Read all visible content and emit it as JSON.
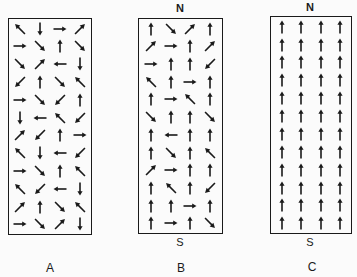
{
  "panels": [
    {
      "id": "A",
      "label": "A",
      "north_label": "",
      "south_label": "",
      "description": "Unmagnetized - random domain orientations",
      "rows": [
        [
          "nw",
          "s",
          "e",
          "ne"
        ],
        [
          "e",
          "se",
          "n",
          "se"
        ],
        [
          "se",
          "ne",
          "w",
          "s"
        ],
        [
          "sw",
          "n",
          "se",
          "nw"
        ],
        [
          "e",
          "se",
          "sw",
          "n"
        ],
        [
          "s",
          "w",
          "nw",
          "sw"
        ],
        [
          "ne",
          "sw",
          "n",
          "e"
        ],
        [
          "nw",
          "s",
          "w",
          "sw"
        ],
        [
          "e",
          "se",
          "n",
          "nw"
        ],
        [
          "nw",
          "sw",
          "w",
          "s"
        ],
        [
          "ne",
          "n",
          "se",
          "nw"
        ],
        [
          "e",
          "se",
          "ne",
          "s"
        ]
      ]
    },
    {
      "id": "B",
      "label": "B",
      "north_label": "N",
      "south_label": "S",
      "description": "Partially magnetized - majority of domains aligned",
      "rows": [
        [
          "n",
          "se",
          "ne",
          "n"
        ],
        [
          "ne",
          "e",
          "n",
          "ne"
        ],
        [
          "e",
          "n",
          "n",
          "sw"
        ],
        [
          "nw",
          "n",
          "e",
          "n"
        ],
        [
          "n",
          "e",
          "nw",
          "n"
        ],
        [
          "se",
          "n",
          "n",
          "se"
        ],
        [
          "n",
          "w",
          "n",
          "n"
        ],
        [
          "n",
          "se",
          "n",
          "nw"
        ],
        [
          "ne",
          "e",
          "n",
          "n"
        ],
        [
          "n",
          "nw",
          "n",
          "sw"
        ],
        [
          "n",
          "n",
          "e",
          "n"
        ],
        [
          "n",
          "e",
          "n",
          "se"
        ]
      ]
    },
    {
      "id": "C",
      "label": "C",
      "north_label": "N",
      "south_label": "S",
      "description": "Fully magnetized - all domains aligned north",
      "rows": [
        [
          "n",
          "n",
          "n",
          "n"
        ],
        [
          "n",
          "n",
          "n",
          "n"
        ],
        [
          "n",
          "n",
          "n",
          "n"
        ],
        [
          "n",
          "n",
          "n",
          "n"
        ],
        [
          "n",
          "n",
          "n",
          "n"
        ],
        [
          "n",
          "n",
          "n",
          "n"
        ],
        [
          "n",
          "n",
          "n",
          "n"
        ],
        [
          "n",
          "n",
          "n",
          "n"
        ],
        [
          "n",
          "n",
          "n",
          "n"
        ],
        [
          "n",
          "n",
          "n",
          "n"
        ],
        [
          "n",
          "n",
          "n",
          "n"
        ],
        [
          "n",
          "n",
          "n",
          "n"
        ]
      ]
    }
  ],
  "icons": {
    "arrow": "arrow-icon"
  },
  "colors": {
    "ink": "#1a1a1a",
    "background": "#fbfbfb"
  }
}
